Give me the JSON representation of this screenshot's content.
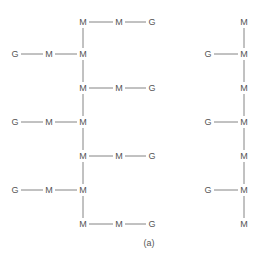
{
  "diagram": {
    "caption": "(a)",
    "colors": {
      "text": "#555555",
      "edge": "#777777",
      "background": "#ffffff"
    },
    "left_structure": {
      "backbone": [
        {
          "id": "b1",
          "label": "M",
          "x": 83,
          "y": 22
        },
        {
          "id": "b2",
          "label": "M",
          "x": 83,
          "y": 54
        },
        {
          "id": "b3",
          "label": "M",
          "x": 83,
          "y": 88
        },
        {
          "id": "b4",
          "label": "M",
          "x": 83,
          "y": 122
        },
        {
          "id": "b5",
          "label": "M",
          "x": 83,
          "y": 156
        },
        {
          "id": "b6",
          "label": "M",
          "x": 83,
          "y": 190
        },
        {
          "id": "b7",
          "label": "M",
          "x": 83,
          "y": 224
        }
      ],
      "branches": [
        {
          "side": "right",
          "y": 22,
          "nodes": [
            {
              "label": "M",
              "x": 119
            },
            {
              "label": "G",
              "x": 152
            }
          ]
        },
        {
          "side": "left",
          "y": 54,
          "nodes": [
            {
              "label": "M",
              "x": 49
            },
            {
              "label": "G",
              "x": 15
            }
          ]
        },
        {
          "side": "right",
          "y": 88,
          "nodes": [
            {
              "label": "M",
              "x": 119
            },
            {
              "label": "G",
              "x": 152
            }
          ]
        },
        {
          "side": "left",
          "y": 122,
          "nodes": [
            {
              "label": "M",
              "x": 49
            },
            {
              "label": "G",
              "x": 15
            }
          ]
        },
        {
          "side": "right",
          "y": 156,
          "nodes": [
            {
              "label": "M",
              "x": 119
            },
            {
              "label": "G",
              "x": 152
            }
          ]
        },
        {
          "side": "left",
          "y": 190,
          "nodes": [
            {
              "label": "M",
              "x": 49
            },
            {
              "label": "G",
              "x": 15
            }
          ]
        },
        {
          "side": "right",
          "y": 224,
          "nodes": [
            {
              "label": "M",
              "x": 119
            },
            {
              "label": "G",
              "x": 152
            }
          ]
        }
      ]
    },
    "right_structure": {
      "backbone": [
        {
          "id": "r1",
          "label": "M",
          "x": 244,
          "y": 22
        },
        {
          "id": "r2",
          "label": "M",
          "x": 244,
          "y": 54
        },
        {
          "id": "r3",
          "label": "M",
          "x": 244,
          "y": 88
        },
        {
          "id": "r4",
          "label": "M",
          "x": 244,
          "y": 122
        },
        {
          "id": "r5",
          "label": "M",
          "x": 244,
          "y": 156
        },
        {
          "id": "r6",
          "label": "M",
          "x": 244,
          "y": 190
        },
        {
          "id": "r7",
          "label": "M",
          "x": 244,
          "y": 224
        }
      ],
      "branches": [
        {
          "side": "left",
          "y": 54,
          "nodes": [
            {
              "label": "G",
              "x": 208
            }
          ]
        },
        {
          "side": "left",
          "y": 122,
          "nodes": [
            {
              "label": "G",
              "x": 208
            }
          ]
        },
        {
          "side": "left",
          "y": 190,
          "nodes": [
            {
              "label": "G",
              "x": 208
            }
          ]
        }
      ]
    }
  }
}
